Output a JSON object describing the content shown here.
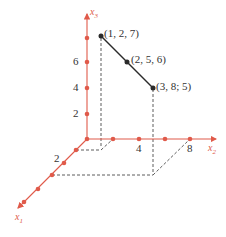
{
  "diagram": {
    "type": "3d-coordinate-plot",
    "colors": {
      "axis": "#e05a4a",
      "segment": "#2a2a2a",
      "dashed": "#333333"
    },
    "axes": [
      {
        "name": "x1",
        "label": "x",
        "sub": "1",
        "ticks": [
          {
            "value": 2,
            "label": "2"
          }
        ]
      },
      {
        "name": "x2",
        "label": "x",
        "sub": "2",
        "ticks": [
          {
            "value": 4,
            "label": "4"
          },
          {
            "value": 8,
            "label": "8"
          }
        ]
      },
      {
        "name": "x3",
        "label": "x",
        "sub": "3",
        "ticks": [
          {
            "value": 2,
            "label": "2"
          },
          {
            "value": 4,
            "label": "4"
          },
          {
            "value": 6,
            "label": "6"
          }
        ]
      }
    ],
    "points": [
      {
        "coords": [
          1,
          2,
          7
        ],
        "label": "(1, 2, 7)"
      },
      {
        "coords": [
          2,
          5,
          6
        ],
        "label": "(2, 5, 6)"
      },
      {
        "coords": [
          3,
          8,
          5
        ],
        "label": "(3, 8; 5)"
      }
    ]
  }
}
